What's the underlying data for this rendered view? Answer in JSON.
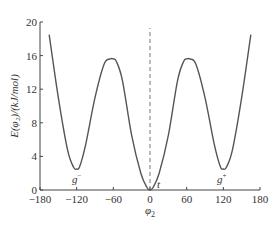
{
  "chart_data": {
    "type": "line",
    "title": "",
    "xlabel": "φ2",
    "ylabel": "E(φ2)/(kJ/mol)",
    "xlim": [
      -180,
      180
    ],
    "ylim": [
      0,
      20
    ],
    "x_ticks": [
      -180,
      -120,
      -60,
      0,
      60,
      120,
      180
    ],
    "y_ticks": [
      0,
      4,
      8,
      12,
      16,
      20
    ],
    "grid": false,
    "legend": null,
    "series": [
      {
        "name": "E(φ2)",
        "style": "solid",
        "x": [
          -165,
          -150,
          -135,
          -125,
          -120,
          -115,
          -105,
          -90,
          -75,
          -65,
          -60,
          -55,
          -45,
          -30,
          -15,
          -5,
          0,
          5,
          15,
          30,
          45,
          55,
          60,
          65,
          75,
          90,
          105,
          115,
          120,
          125,
          135,
          150,
          165
        ],
        "y": [
          18.5,
          11.0,
          4.8,
          2.7,
          2.5,
          2.8,
          5.5,
          11.0,
          15.0,
          15.6,
          15.6,
          15.3,
          13.0,
          6.5,
          2.0,
          0.3,
          0.0,
          0.3,
          2.0,
          6.5,
          13.0,
          15.3,
          15.6,
          15.6,
          15.0,
          11.0,
          5.5,
          2.8,
          2.5,
          2.7,
          4.8,
          11.0,
          18.5
        ]
      }
    ],
    "reference_lines": [
      {
        "orientation": "vertical",
        "x": 0,
        "style": "dashed"
      }
    ],
    "annotations": [
      {
        "text": "g⁻",
        "x": -120,
        "y": 1.0
      },
      {
        "text": "t",
        "x": 8,
        "y": 0.5
      },
      {
        "text": "g⁺",
        "x": 120,
        "y": 1.0
      }
    ]
  },
  "labels": {
    "x_ticks": [
      "-180",
      "-120",
      "-60",
      "0",
      "60",
      "120",
      "180"
    ],
    "y_ticks": [
      "0",
      "4",
      "8",
      "12",
      "16",
      "20"
    ],
    "xlabel_main": "φ",
    "xlabel_sub": "2",
    "ylabel": "E(φ₂)/(kJ/mol)",
    "anno_gminus": "g",
    "anno_gminus_sup": "−",
    "anno_t": "t",
    "anno_gplus": "g",
    "anno_gplus_sup": "+"
  }
}
